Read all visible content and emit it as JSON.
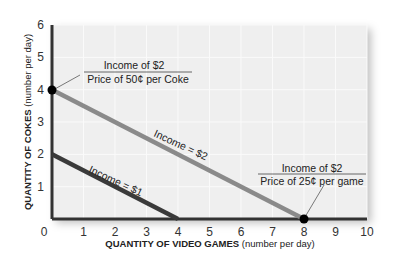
{
  "chart_data": {
    "type": "line",
    "title": "",
    "xlabel": "QUANTITY OF VIDEO GAMES (number per day)",
    "ylabel": "QUANTITY OF COKES (number per day)",
    "xlabel_bold": "QUANTITY OF VIDEO GAMES",
    "xlabel_rest": "(number per day)",
    "ylabel_bold": "QUANTITY OF COKES",
    "ylabel_rest": "(number per day)",
    "xlim": [
      0,
      10
    ],
    "ylim": [
      0,
      6
    ],
    "x_ticks": [
      "0",
      "1",
      "2",
      "3",
      "4",
      "5",
      "6",
      "7",
      "8",
      "9",
      "10"
    ],
    "y_ticks": [
      "1",
      "2",
      "3",
      "4",
      "5",
      "6"
    ],
    "grid": true,
    "series": [
      {
        "name": "Income = $2",
        "label": "Income = $2",
        "color": "#8a8a8a",
        "points": [
          [
            0,
            4
          ],
          [
            8,
            0
          ]
        ]
      },
      {
        "name": "Income = $1",
        "label": "Income = $1",
        "color": "#3a3a3a",
        "points": [
          [
            0,
            2
          ],
          [
            4,
            0
          ]
        ]
      }
    ],
    "annotations": [
      {
        "numerator": "Income of $2",
        "denominator": "Price of 50¢ per Coke",
        "point": [
          0,
          4
        ]
      },
      {
        "numerator": "Income of $2",
        "denominator": "Price of 25¢ per game",
        "point": [
          8,
          0
        ]
      }
    ]
  }
}
